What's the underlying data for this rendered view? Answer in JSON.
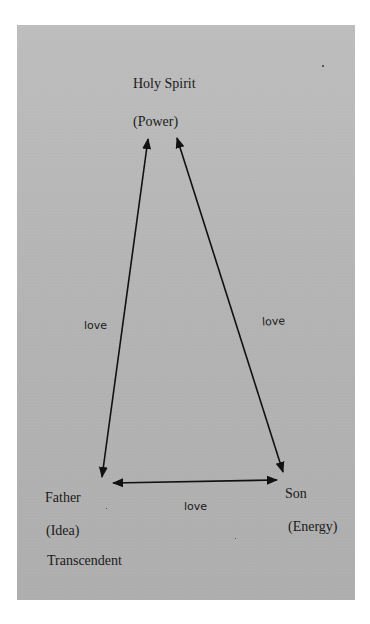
{
  "diagram": {
    "nodes": {
      "top": {
        "name": "Holy Spirit",
        "attribute": "(Power)"
      },
      "bottom_left": {
        "name": "Father",
        "attribute": "(Idea)",
        "note": "Transcendent"
      },
      "bottom_right": {
        "name": "Son",
        "attribute": "(Energy)"
      }
    },
    "edges": [
      {
        "from": "Father",
        "to": "Holy Spirit",
        "label": "love",
        "direction": "bidirectional"
      },
      {
        "from": "Son",
        "to": "Holy Spirit",
        "label": "love",
        "direction": "bidirectional"
      },
      {
        "from": "Father",
        "to": "Son",
        "label": "love",
        "direction": "bidirectional"
      }
    ]
  },
  "colors": {
    "page": "#b5b5b5",
    "ink": "#1a1a1a",
    "margin": "#ffffff"
  }
}
